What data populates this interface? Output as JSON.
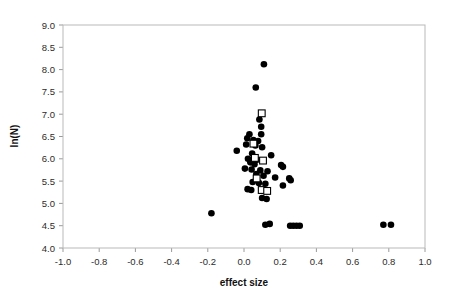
{
  "chart_data": {
    "type": "scatter",
    "title": "",
    "xlabel": "effect size",
    "ylabel": "ln(N)",
    "xlim": [
      -1.0,
      1.0
    ],
    "ylim": [
      4.0,
      9.0
    ],
    "xticks": [
      -1.0,
      -0.8,
      -0.6,
      -0.4,
      -0.2,
      0.0,
      0.2,
      0.4,
      0.6,
      0.8,
      1.0
    ],
    "xtick_labels": [
      "-1.0",
      "-0.8",
      "-0.6",
      "-0.4",
      "-0.2",
      "0.0",
      "0.2",
      "0.4",
      "0.6",
      "0.8",
      "1.0"
    ],
    "yticks": [
      4.0,
      4.5,
      5.0,
      5.5,
      6.0,
      6.5,
      7.0,
      7.5,
      8.0,
      8.5,
      9.0
    ],
    "ytick_labels": [
      "4.0",
      "4.5",
      "5.0",
      "5.5",
      "6.0",
      "6.5",
      "7.0",
      "7.5",
      "8.0",
      "8.5",
      "9.0"
    ],
    "grid": false,
    "legend": null,
    "marker_colors": {
      "circle": "#000000",
      "square_edge": "#000000",
      "square_fill": "#ffffff"
    },
    "series": [
      {
        "name": "filled-circles",
        "marker": "circle",
        "points": [
          [
            0.11,
            8.12
          ],
          [
            0.065,
            7.6
          ],
          [
            0.085,
            6.88
          ],
          [
            0.095,
            6.72
          ],
          [
            0.03,
            6.55
          ],
          [
            0.095,
            6.55
          ],
          [
            0.018,
            6.46
          ],
          [
            0.052,
            6.42
          ],
          [
            0.078,
            6.4
          ],
          [
            0.012,
            6.32
          ],
          [
            0.063,
            6.3
          ],
          [
            0.1,
            6.26
          ],
          [
            -0.04,
            6.18
          ],
          [
            0.045,
            6.12
          ],
          [
            0.15,
            6.08
          ],
          [
            0.022,
            6.0
          ],
          [
            0.072,
            5.98
          ],
          [
            0.035,
            5.92
          ],
          [
            0.058,
            5.88
          ],
          [
            0.205,
            5.86
          ],
          [
            0.215,
            5.82
          ],
          [
            0.005,
            5.78
          ],
          [
            0.042,
            5.76
          ],
          [
            0.09,
            5.74
          ],
          [
            0.13,
            5.72
          ],
          [
            0.068,
            5.66
          ],
          [
            0.108,
            5.62
          ],
          [
            0.172,
            5.58
          ],
          [
            0.25,
            5.56
          ],
          [
            0.258,
            5.52
          ],
          [
            0.048,
            5.48
          ],
          [
            0.082,
            5.46
          ],
          [
            0.118,
            5.44
          ],
          [
            0.215,
            5.4
          ],
          [
            0.02,
            5.32
          ],
          [
            0.04,
            5.3
          ],
          [
            0.1,
            5.12
          ],
          [
            0.125,
            5.1
          ],
          [
            -0.18,
            4.78
          ],
          [
            0.118,
            4.52
          ],
          [
            0.142,
            4.54
          ],
          [
            0.255,
            4.5
          ],
          [
            0.272,
            4.5
          ],
          [
            0.29,
            4.5
          ],
          [
            0.308,
            4.5
          ],
          [
            0.77,
            4.52
          ],
          [
            0.812,
            4.52
          ]
        ]
      },
      {
        "name": "open-squares",
        "marker": "square",
        "points": [
          [
            0.098,
            7.02
          ],
          [
            0.052,
            6.34
          ],
          [
            0.06,
            6.02
          ],
          [
            0.105,
            5.96
          ],
          [
            0.07,
            5.56
          ],
          [
            0.098,
            5.3
          ],
          [
            0.128,
            5.28
          ]
        ]
      }
    ]
  },
  "axes": {
    "x_title": "effect size",
    "y_title": "ln(N)"
  }
}
